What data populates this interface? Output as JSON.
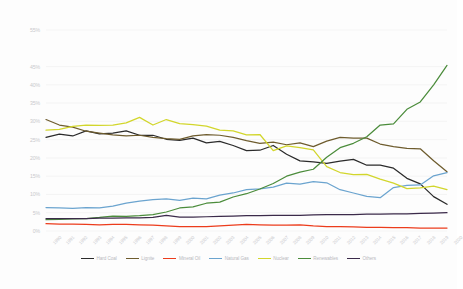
{
  "chart_data": {
    "type": "line",
    "title": "",
    "subtitle": "",
    "xlabel": "",
    "ylabel": "",
    "grid": true,
    "legend_position": "bottom",
    "ylim": [
      0,
      55
    ],
    "yticks": [
      "0%",
      "5%",
      "10%",
      "15%",
      "20%",
      "25%",
      "30%",
      "35%",
      "40%",
      "45%",
      "55%"
    ],
    "ytick_values": [
      0,
      5,
      10,
      15,
      20,
      25,
      30,
      35,
      40,
      45,
      55
    ],
    "categories": [
      "1990",
      "1991",
      "1992",
      "1993",
      "1994",
      "1995",
      "1996",
      "1997",
      "1998",
      "1999",
      "2000",
      "2001",
      "2002",
      "2003",
      "2004",
      "2005",
      "2006",
      "2007",
      "2008",
      "2009",
      "2010",
      "2011",
      "2012",
      "2013",
      "2014",
      "2015",
      "2016",
      "2017",
      "2018",
      "2019",
      "2020"
    ],
    "series": [
      {
        "name": "Hard Coal",
        "color": "#2b2b2b",
        "values": [
          25.6,
          26.5,
          26.0,
          27.4,
          26.6,
          26.8,
          27.4,
          26.2,
          26.2,
          25.1,
          24.8,
          25.4,
          24.1,
          24.5,
          23.4,
          22.0,
          22.1,
          23.4,
          21.0,
          19.2,
          18.9,
          18.5,
          19.1,
          19.6,
          18.0,
          18.0,
          17.2,
          14.4,
          12.9,
          9.4,
          7.3
        ]
      },
      {
        "name": "Lignite",
        "color": "#6e5c2e",
        "values": [
          30.5,
          29.0,
          28.4,
          27.3,
          26.8,
          26.3,
          26.0,
          26.2,
          25.6,
          25.3,
          25.1,
          26.0,
          26.4,
          26.2,
          25.6,
          24.7,
          24.0,
          24.3,
          23.6,
          24.1,
          23.1,
          24.6,
          25.6,
          25.4,
          25.4,
          23.8,
          23.1,
          22.6,
          22.5,
          19.2,
          16.2
        ]
      },
      {
        "name": "Mineral Oil",
        "color": "#ec3c1c",
        "values": [
          2.0,
          1.9,
          1.9,
          1.8,
          1.7,
          1.8,
          1.8,
          1.7,
          1.6,
          1.4,
          1.2,
          1.2,
          1.2,
          1.4,
          1.6,
          1.8,
          1.7,
          1.6,
          1.6,
          1.7,
          1.4,
          1.2,
          1.2,
          1.1,
          1.0,
          1.0,
          0.9,
          0.9,
          0.8,
          0.8,
          0.8
        ]
      },
      {
        "name": "Natural Gas",
        "color": "#6ba4cf"
      },
      {
        "name": "Nuclear",
        "color": "#d2d62c"
      },
      {
        "name": "Renewables",
        "color": "#4b8c3b"
      },
      {
        "name": "Others",
        "color": "#3b2a4a"
      }
    ],
    "series_values": {
      "Natural Gas": [
        6.4,
        6.3,
        6.2,
        6.4,
        6.3,
        6.8,
        7.6,
        8.2,
        8.6,
        8.8,
        8.4,
        9.0,
        8.8,
        9.8,
        10.4,
        11.3,
        11.5,
        12.0,
        13.1,
        12.8,
        13.5,
        13.2,
        11.3,
        10.4,
        9.5,
        9.1,
        11.9,
        12.5,
        12.6,
        15.1,
        16.0
      ]
    },
    "nuclear_values": [
      27.6,
      27.8,
      28.6,
      29.0,
      28.9,
      29.0,
      29.6,
      31.1,
      29.0,
      30.5,
      29.4,
      29.1,
      28.7,
      27.6,
      27.4,
      26.3,
      26.4,
      22.0,
      23.3,
      22.8,
      22.2,
      17.6,
      16.0,
      15.4,
      15.5,
      14.2,
      13.1,
      11.6,
      11.8,
      12.3,
      11.3
    ],
    "renewables_values": [
      3.1,
      3.2,
      3.3,
      3.4,
      3.7,
      4.1,
      4.0,
      4.2,
      4.5,
      5.2,
      6.3,
      6.6,
      7.6,
      7.9,
      9.3,
      10.2,
      11.5,
      13.0,
      15.0,
      16.1,
      16.9,
      20.2,
      22.8,
      24.0,
      25.8,
      29.0,
      29.3,
      33.3,
      35.3,
      40.0,
      45.3
    ],
    "others_values": [
      3.4,
      3.4,
      3.4,
      3.4,
      3.5,
      3.5,
      3.6,
      3.6,
      3.7,
      4.3,
      3.8,
      3.8,
      3.9,
      4.0,
      4.1,
      4.2,
      4.2,
      4.3,
      4.3,
      4.3,
      4.4,
      4.5,
      4.5,
      4.5,
      4.6,
      4.6,
      4.7,
      4.7,
      4.8,
      4.9,
      5.0
    ]
  },
  "legend": {
    "items": [
      {
        "label": "Hard Coal",
        "color": "#2b2b2b"
      },
      {
        "label": "Lignite",
        "color": "#6e5c2e"
      },
      {
        "label": "Mineral Oil",
        "color": "#ec3c1c"
      },
      {
        "label": "Natural Gas",
        "color": "#6ba4cf"
      },
      {
        "label": "Nuclear",
        "color": "#d2d62c"
      },
      {
        "label": "Renewables",
        "color": "#4b8c3b"
      },
      {
        "label": "Others",
        "color": "#3b2a4a"
      }
    ]
  }
}
